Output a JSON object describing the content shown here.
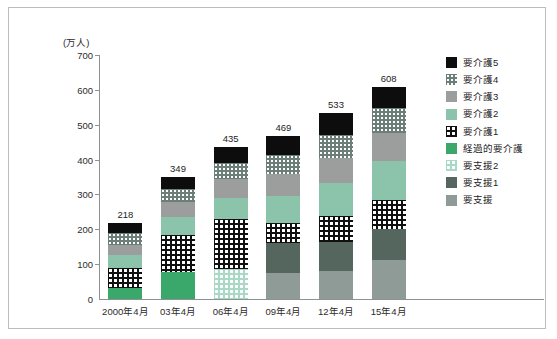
{
  "figure": {
    "unit_label": "(万人)"
  },
  "chart_data": {
    "type": "bar",
    "stacked": true,
    "title": "",
    "xlabel": "",
    "ylabel": "(万人)",
    "ylim": [
      0,
      700
    ],
    "ytick_values": [
      0,
      100,
      200,
      300,
      400,
      500,
      600,
      700
    ],
    "ytick_labels": [
      "0",
      "100",
      "200",
      "300",
      "400",
      "500",
      "600",
      "700"
    ],
    "grid": false,
    "legend_position": "right",
    "categories": [
      "2000年4月",
      "03年4月",
      "06年4月",
      "09年4月",
      "12年4月",
      "15年4月"
    ],
    "totals": [
      218,
      349,
      435,
      469,
      533,
      608
    ],
    "total_labels": [
      "218",
      "349",
      "435",
      "469",
      "533",
      "608"
    ],
    "series": [
      {
        "name": "要介護5",
        "key": "k5",
        "color": "#0d0d0d",
        "pattern": "solid",
        "values": [
          29,
          34,
          46,
          56,
          61,
          60
        ]
      },
      {
        "name": "要介護4",
        "key": "k4",
        "color": "#6b7e77",
        "pattern": "dots-small",
        "values": [
          34,
          38,
          45,
          54,
          66,
          73
        ]
      },
      {
        "name": "要介護3",
        "key": "k3",
        "color": "#9b9e9d",
        "pattern": "solid",
        "values": [
          28,
          42,
          53,
          64,
          73,
          80
        ]
      },
      {
        "name": "要介護2",
        "key": "k2",
        "color": "#8cc4ab",
        "pattern": "solid",
        "values": [
          39,
          50,
          61,
          76,
          95,
          110
        ]
      },
      {
        "name": "要介護1",
        "key": "k1",
        "color": "#101010",
        "pattern": "dots-large",
        "values": [
          55,
          107,
          143,
          57,
          74,
          84
        ]
      },
      {
        "name": "経過的要介護",
        "key": "kk",
        "color": "#3aa86a",
        "pattern": "solid",
        "values": [
          33,
          78,
          0,
          0,
          0,
          0
        ]
      },
      {
        "name": "要支援2",
        "key": "s2",
        "color": "#a9d9c6",
        "pattern": "dots-light",
        "values": [
          0,
          0,
          87,
          0,
          0,
          0
        ]
      },
      {
        "name": "要支援1",
        "key": "s1",
        "color": "#55665f",
        "pattern": "solid",
        "values": [
          0,
          0,
          0,
          88,
          85,
          88
        ]
      },
      {
        "name": "要支援",
        "key": "s0",
        "color": "#8f9b96",
        "pattern": "solid",
        "values": [
          0,
          0,
          0,
          74,
          79,
          113
        ]
      }
    ]
  },
  "legend": {
    "items": [
      {
        "label": "要介護5",
        "key": "k5"
      },
      {
        "label": "要介護4",
        "key": "k4"
      },
      {
        "label": "要介護3",
        "key": "k3"
      },
      {
        "label": "要介護2",
        "key": "k2"
      },
      {
        "label": "要介護1",
        "key": "k1"
      },
      {
        "label": "経過的要介護",
        "key": "kk"
      },
      {
        "label": "要支援2",
        "key": "s2"
      },
      {
        "label": "要支援1",
        "key": "s1"
      },
      {
        "label": "要支援",
        "key": "s0"
      }
    ]
  }
}
